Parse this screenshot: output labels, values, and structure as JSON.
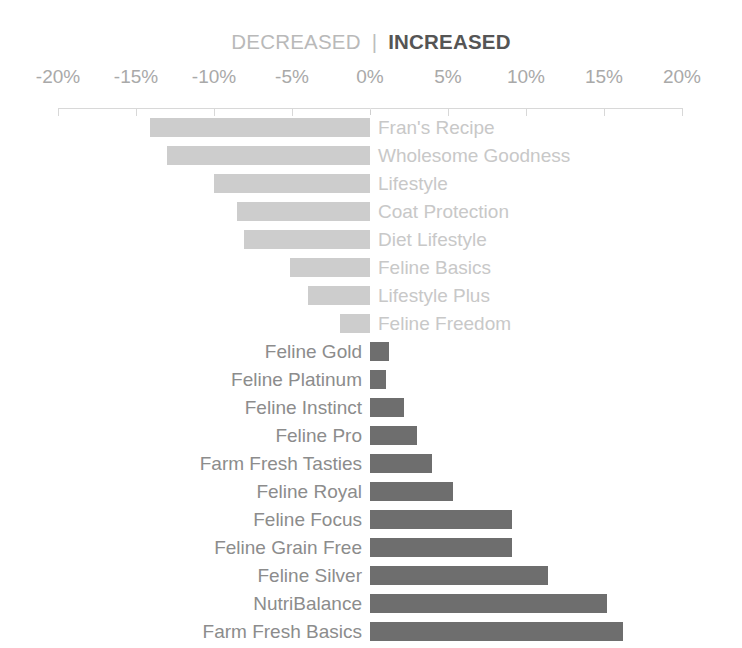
{
  "legend": {
    "decreased_label": "DECREASED",
    "divider": "|",
    "increased_label": "INCREASED"
  },
  "colors": {
    "decreased_bar": "#cdcdcd",
    "increased_bar": "#6e6e6e",
    "decreased_label": "#c8c8c8",
    "increased_label": "#8c8c8c",
    "axis": "#d8d8d8",
    "tick_label": "#a9a9a9"
  },
  "chart_data": {
    "type": "bar",
    "orientation": "horizontal",
    "title": "",
    "subtitle": "",
    "xlabel": "",
    "ylabel": "",
    "xlim": [
      -20,
      20
    ],
    "grid": false,
    "legend_position": "top-center",
    "tick_labels": [
      "-20%",
      "-15%",
      "-10%",
      "-5%",
      "0%",
      "5%",
      "10%",
      "15%",
      "20%"
    ],
    "tick_values": [
      -20,
      -15,
      -10,
      -5,
      0,
      5,
      10,
      15,
      20
    ],
    "series": [
      {
        "name": "DECREASED",
        "color": "#cdcdcd"
      },
      {
        "name": "INCREASED",
        "color": "#6e6e6e"
      }
    ],
    "categories": [
      "Fran's Recipe",
      "Wholesome Goodness",
      "Lifestyle",
      "Coat Protection",
      "Diet Lifestyle",
      "Feline Basics",
      "Lifestyle Plus",
      "Feline Freedom",
      "Feline Gold",
      "Feline Platinum",
      "Feline Instinct",
      "Feline Pro",
      "Farm Fresh Tasties",
      "Feline Royal",
      "Feline Focus",
      "Feline Grain Free",
      "Feline Silver",
      "NutriBalance",
      "Farm Fresh Basics"
    ],
    "values": [
      -14.1,
      -13.0,
      -10.0,
      -8.5,
      -8.1,
      -5.1,
      -4.0,
      -1.9,
      1.2,
      1.0,
      2.2,
      3.0,
      4.0,
      5.3,
      9.1,
      9.1,
      11.4,
      15.2,
      16.2
    ]
  },
  "bars": [
    {
      "label": "Fran's Recipe",
      "value": -14.1,
      "direction": "decreased"
    },
    {
      "label": "Wholesome Goodness",
      "value": -13.0,
      "direction": "decreased"
    },
    {
      "label": "Lifestyle",
      "value": -10.0,
      "direction": "decreased"
    },
    {
      "label": "Coat Protection",
      "value": -8.5,
      "direction": "decreased"
    },
    {
      "label": "Diet Lifestyle",
      "value": -8.1,
      "direction": "decreased"
    },
    {
      "label": "Feline Basics",
      "value": -5.1,
      "direction": "decreased"
    },
    {
      "label": "Lifestyle Plus",
      "value": -4.0,
      "direction": "decreased"
    },
    {
      "label": "Feline Freedom",
      "value": -1.9,
      "direction": "decreased"
    },
    {
      "label": "Feline Gold",
      "value": 1.2,
      "direction": "increased"
    },
    {
      "label": "Feline Platinum",
      "value": 1.0,
      "direction": "increased"
    },
    {
      "label": "Feline Instinct",
      "value": 2.2,
      "direction": "increased"
    },
    {
      "label": "Feline Pro",
      "value": 3.0,
      "direction": "increased"
    },
    {
      "label": "Farm Fresh Tasties",
      "value": 4.0,
      "direction": "increased"
    },
    {
      "label": "Feline Royal",
      "value": 5.3,
      "direction": "increased"
    },
    {
      "label": "Feline Focus",
      "value": 9.1,
      "direction": "increased"
    },
    {
      "label": "Feline Grain Free",
      "value": 9.1,
      "direction": "increased"
    },
    {
      "label": "Feline Silver",
      "value": 11.4,
      "direction": "increased"
    },
    {
      "label": "NutriBalance",
      "value": 15.2,
      "direction": "increased"
    },
    {
      "label": "Farm Fresh Basics",
      "value": 16.2,
      "direction": "increased"
    }
  ]
}
